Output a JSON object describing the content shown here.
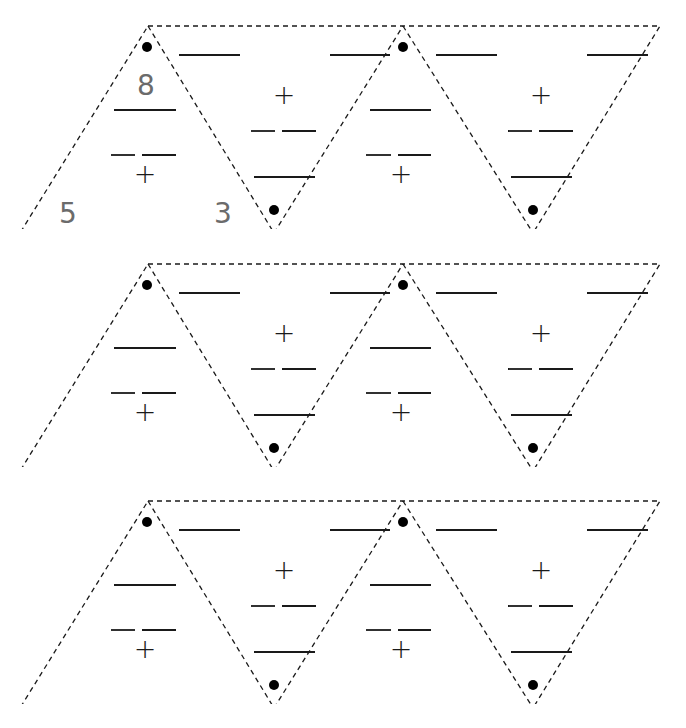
{
  "page": {
    "background_color": "#ffffff",
    "width": 686,
    "height": 728
  },
  "style": {
    "outline_color": "#1a1a1a",
    "blank_line_color": "#1a1a1a",
    "operator_color": "#1a1a1a",
    "handwriting_color": "#6b6b6b",
    "dot_color": "#000000",
    "dash_pattern": "5 4"
  },
  "legend": {
    "plus_symbol": "+",
    "equals_symbol": "=",
    "blank_answer_line": "____",
    "vertex_dot": "●"
  },
  "rows": [
    {
      "id": "row-1",
      "top": 20,
      "filled": true,
      "cells": [
        {
          "id": "r1-t1",
          "orientation": "upright",
          "values": {
            "top": "8",
            "bottom_left": "5",
            "bottom_right": "3"
          },
          "operator": "+",
          "relation": "="
        },
        {
          "id": "r1-t2",
          "orientation": "inverted",
          "values": {
            "top": "",
            "bottom_left": "",
            "bottom_right": ""
          },
          "operator": "+",
          "relation": "="
        },
        {
          "id": "r1-t3",
          "orientation": "upright",
          "values": {
            "top": "",
            "bottom_left": "",
            "bottom_right": ""
          },
          "operator": "+",
          "relation": "="
        },
        {
          "id": "r1-t4",
          "orientation": "inverted",
          "values": {
            "top": "",
            "bottom_left": "",
            "bottom_right": ""
          },
          "operator": "+",
          "relation": "="
        }
      ]
    },
    {
      "id": "row-2",
      "top": 258,
      "filled": false,
      "cells": [
        {
          "id": "r2-t1",
          "orientation": "upright",
          "values": {
            "top": "",
            "bottom_left": "",
            "bottom_right": ""
          },
          "operator": "+",
          "relation": "="
        },
        {
          "id": "r2-t2",
          "orientation": "inverted",
          "values": {
            "top": "",
            "bottom_left": "",
            "bottom_right": ""
          },
          "operator": "+",
          "relation": "="
        },
        {
          "id": "r2-t3",
          "orientation": "upright",
          "values": {
            "top": "",
            "bottom_left": "",
            "bottom_right": ""
          },
          "operator": "+",
          "relation": "="
        },
        {
          "id": "r2-t4",
          "orientation": "inverted",
          "values": {
            "top": "",
            "bottom_left": "",
            "bottom_right": ""
          },
          "operator": "+",
          "relation": "="
        }
      ]
    },
    {
      "id": "row-3",
      "top": 495,
      "filled": false,
      "cells": [
        {
          "id": "r3-t1",
          "orientation": "upright",
          "values": {
            "top": "",
            "bottom_left": "",
            "bottom_right": ""
          },
          "operator": "+",
          "relation": "="
        },
        {
          "id": "r3-t2",
          "orientation": "inverted",
          "values": {
            "top": "",
            "bottom_left": "",
            "bottom_right": ""
          },
          "operator": "+",
          "relation": "="
        },
        {
          "id": "r3-t3",
          "orientation": "upright",
          "values": {
            "top": "",
            "bottom_left": "",
            "bottom_right": ""
          },
          "operator": "+",
          "relation": "="
        },
        {
          "id": "r3-t4",
          "orientation": "inverted",
          "values": {
            "top": "",
            "bottom_left": "",
            "bottom_right": ""
          },
          "operator": "+",
          "relation": "="
        }
      ]
    }
  ]
}
